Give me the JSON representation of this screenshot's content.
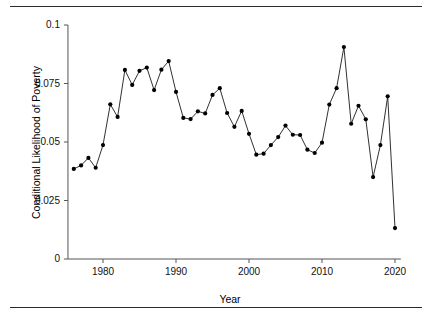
{
  "figure": {
    "top_rule": "",
    "bottom_rule": ""
  },
  "chart_data": {
    "type": "line",
    "title": "",
    "subtitle": "",
    "xlabel": "Year",
    "ylabel": "Conditional Likelihood of Poverty",
    "xlim": [
      1975.2,
      2020.8
    ],
    "ylim": [
      0,
      0.1
    ],
    "grid": false,
    "legend": null,
    "marker": "filled-circle",
    "line_color": "#1a1a1a",
    "marker_color": "#000000",
    "xticks": [
      1980,
      1990,
      2000,
      2010,
      2020
    ],
    "xtick_labels": [
      "1980",
      "1990",
      "2000",
      "2010",
      "2020"
    ],
    "yticks": [
      0,
      0.025,
      0.05,
      0.075,
      0.1
    ],
    "ytick_labels": [
      "0",
      "0.025",
      "0.05",
      "0.075",
      "0.1"
    ],
    "x": [
      1976,
      1977,
      1978,
      1979,
      1980,
      1981,
      1982,
      1983,
      1984,
      1985,
      1986,
      1987,
      1988,
      1989,
      1990,
      1991,
      1992,
      1993,
      1994,
      1995,
      1996,
      1997,
      1998,
      1999,
      2000,
      2001,
      2002,
      2003,
      2004,
      2005,
      2006,
      2007,
      2008,
      2009,
      2010,
      2011,
      2012,
      2013,
      2014,
      2015,
      2016,
      2017,
      2018,
      2019,
      2020
    ],
    "values": [
      0.0385,
      0.04,
      0.0432,
      0.039,
      0.0487,
      0.0661,
      0.0607,
      0.0808,
      0.0744,
      0.0804,
      0.0818,
      0.0722,
      0.0809,
      0.0846,
      0.0714,
      0.0603,
      0.0598,
      0.0631,
      0.0622,
      0.0701,
      0.073,
      0.0624,
      0.0565,
      0.0633,
      0.0535,
      0.0446,
      0.045,
      0.0487,
      0.0521,
      0.057,
      0.0531,
      0.053,
      0.0467,
      0.0453,
      0.0497,
      0.066,
      0.073,
      0.0906,
      0.0578,
      0.0655,
      0.0597,
      0.035,
      0.0487,
      0.0695,
      0.0132
    ],
    "series": [
      {
        "name": "Conditional Likelihood of Poverty",
        "values": [
          0.0385,
          0.04,
          0.0432,
          0.039,
          0.0487,
          0.0661,
          0.0607,
          0.0808,
          0.0744,
          0.0804,
          0.0818,
          0.0722,
          0.0809,
          0.0846,
          0.0714,
          0.0603,
          0.0598,
          0.0631,
          0.0622,
          0.0701,
          0.073,
          0.0624,
          0.0565,
          0.0633,
          0.0535,
          0.0446,
          0.045,
          0.0487,
          0.0521,
          0.057,
          0.0531,
          0.053,
          0.0467,
          0.0453,
          0.0497,
          0.066,
          0.073,
          0.0906,
          0.0578,
          0.0655,
          0.0597,
          0.035,
          0.0487,
          0.0695,
          0.0132
        ]
      }
    ]
  }
}
